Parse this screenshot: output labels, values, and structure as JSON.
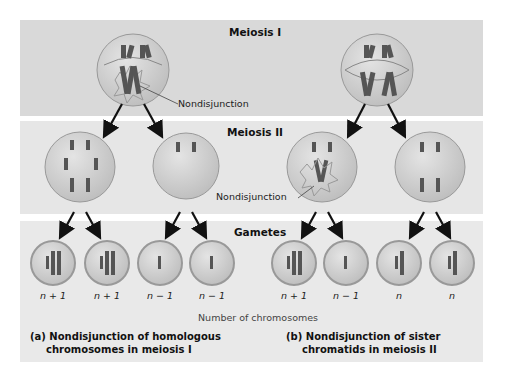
{
  "stages": {
    "meiosis1": "Meiosis I",
    "meiosis2": "Meiosis II",
    "gametes": "Gametes"
  },
  "annotations": {
    "nondisjunction_a": "Nondisjunction",
    "nondisjunction_b": "Nondisjunction"
  },
  "gamete_counts": {
    "a": [
      "n + 1",
      "n + 1",
      "n − 1",
      "n − 1"
    ],
    "b": [
      "n + 1",
      "n − 1",
      "n",
      "n"
    ]
  },
  "axis_label": "Number of chromosomes",
  "captions": {
    "a_line1": "(a) Nondisjunction of homologous",
    "a_line2": "chromosomes in meiosis I",
    "b_line1": "(b) Nondisjunction of sister",
    "b_line2": "chromatids in meiosis II"
  },
  "colors": {
    "band": "#d9d9d9",
    "cell": "#c8c8c8",
    "chromosome": "#555555",
    "arrow": "#111111"
  }
}
